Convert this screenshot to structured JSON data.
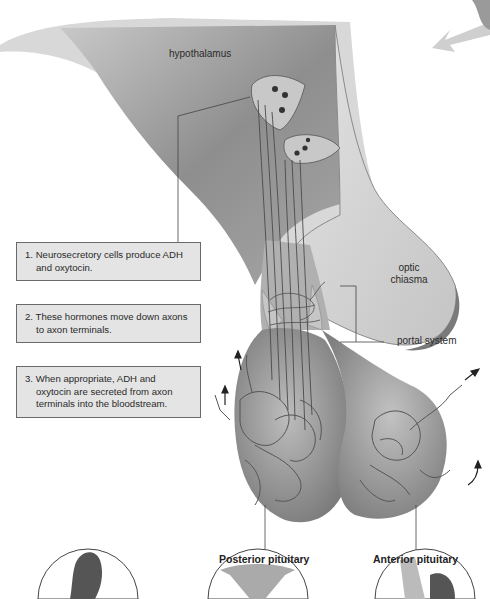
{
  "diagram": {
    "labels": {
      "hypothalamus": "hypothalamus",
      "optic_chiasma_line1": "optic",
      "optic_chiasma_line2": "chiasma",
      "portal_system": "portal system",
      "posterior_pituitary": "Posterior pituitary",
      "anterior_pituitary": "Anterior pituitary"
    },
    "steps": [
      {
        "number": "1.",
        "text": "Neurosecretory cells produce ADH and oxytocin."
      },
      {
        "number": "2.",
        "text": "These hormones move down axons to axon terminals."
      },
      {
        "number": "3.",
        "text": "When appropriate, ADH and oxytocin are secreted from axon terminals into the bloodstream."
      }
    ],
    "target_organs": [
      {
        "name": "kidney-illustration"
      },
      {
        "name": "uterus-illustration"
      },
      {
        "name": "mammary-gland-illustration"
      }
    ],
    "colors": {
      "tissue_dark": "#8a8a8a",
      "tissue_mid": "#b8b8b8",
      "tissue_light": "#d6d6d6",
      "box_fill": "#e4e4e4",
      "box_border": "#6a6a6a",
      "vessel": "#5a5a5a"
    }
  }
}
